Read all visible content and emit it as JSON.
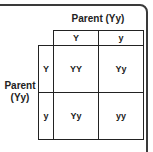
{
  "diagram": {
    "type": "punnett-square",
    "top_parent_label": "Parent (Yy)",
    "side_parent_label_line1": "Parent",
    "side_parent_label_line2": "(Yy)",
    "column_alleles": [
      "Y",
      "y"
    ],
    "row_alleles": [
      "Y",
      "y"
    ],
    "cells": [
      [
        "YY",
        "Yy"
      ],
      [
        "Yy",
        "yy"
      ]
    ]
  }
}
